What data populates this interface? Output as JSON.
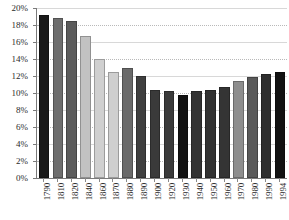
{
  "chart_data": {
    "type": "bar",
    "title": "",
    "subtitle": "",
    "xlabel": "",
    "ylabel": "",
    "ylim": [
      0,
      20
    ],
    "ytick_labels": [
      "20%",
      "18%",
      "16%",
      "14%",
      "12%",
      "10%",
      "8%",
      "6%",
      "4%",
      "2%",
      "0%"
    ],
    "ytick_values": [
      20,
      18,
      16,
      14,
      12,
      10,
      8,
      6,
      4,
      2,
      0
    ],
    "grid": true,
    "grid_axis": "y",
    "legend": "none",
    "value_suffix": "%",
    "categories": [
      "1790",
      "1810",
      "1820",
      "1840",
      "1860",
      "1870",
      "1880",
      "1890",
      "1900",
      "1920",
      "1930",
      "1940",
      "1950",
      "1960",
      "1970",
      "1980",
      "1990",
      "1994"
    ],
    "values": [
      19.2,
      18.8,
      18.5,
      16.7,
      14.0,
      12.5,
      13.0,
      12.0,
      10.4,
      10.2,
      9.8,
      10.2,
      10.3,
      10.7,
      11.4,
      11.9,
      12.2,
      12.5
    ],
    "bar_colors": [
      "#1a1a1a",
      "#6e6e6e",
      "#5c5c5c",
      "#c2c2c2",
      "#d0d0d0",
      "#cfcfcf",
      "#6a6a6a",
      "#3f3f3f",
      "#3a3a3a",
      "#3a3a3a",
      "#121212",
      "#333333",
      "#323232",
      "#343434",
      "#8e8e8e",
      "#5a5a5a",
      "#2e2e2e",
      "#121212"
    ],
    "axis_color": "#7a7a7a",
    "gridline_color": "#b9b9b9",
    "background": "#ffffff"
  }
}
